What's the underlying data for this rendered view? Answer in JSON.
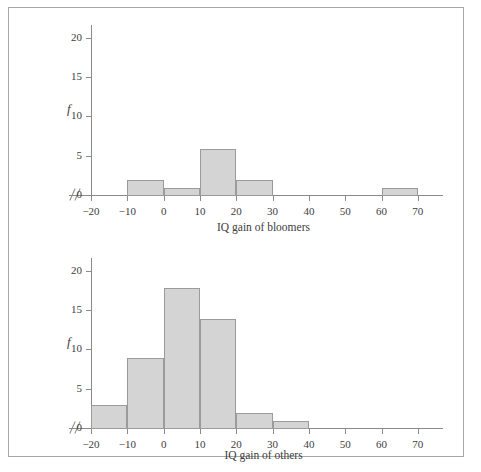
{
  "figure": {
    "y_axis_label": "f",
    "bar_fill_color": "#d4d4d4",
    "bar_border_color": "#9b9b9b",
    "axis_color": "#8a8a8a",
    "frame_color": "#a8a8a8"
  },
  "chart_data": [
    {
      "type": "bar",
      "title": "",
      "xlabel": "IQ gain of bloomers",
      "ylabel": "f",
      "xlim": [
        -20,
        75
      ],
      "ylim": [
        0,
        21
      ],
      "xticks": [
        -20,
        -10,
        0,
        10,
        20,
        30,
        40,
        50,
        60,
        70
      ],
      "yticks": [
        0,
        5,
        10,
        15,
        20
      ],
      "xtick_labels": [
        "-20",
        "-10",
        "0",
        "10",
        "20",
        "30",
        "40",
        "50",
        "60",
        "70"
      ],
      "ytick_labels": [
        "0",
        "5",
        "10",
        "15",
        "20"
      ],
      "axis_break": true,
      "grid": false,
      "legend": false,
      "bin_width": 10,
      "bins": [
        {
          "start": -10,
          "end": 0,
          "value": 2
        },
        {
          "start": 0,
          "end": 10,
          "value": 1
        },
        {
          "start": 10,
          "end": 20,
          "value": 6
        },
        {
          "start": 20,
          "end": 30,
          "value": 2
        },
        {
          "start": 60,
          "end": 70,
          "value": 1
        }
      ]
    },
    {
      "type": "bar",
      "title": "",
      "xlabel": "IQ gain of others",
      "ylabel": "f",
      "xlim": [
        -20,
        75
      ],
      "ylim": [
        0,
        21
      ],
      "xticks": [
        -20,
        -10,
        0,
        10,
        20,
        30,
        40,
        50,
        60,
        70
      ],
      "yticks": [
        0,
        5,
        10,
        15,
        20
      ],
      "xtick_labels": [
        "-20",
        "-10",
        "0",
        "10",
        "20",
        "30",
        "40",
        "50",
        "60",
        "70"
      ],
      "ytick_labels": [
        "0",
        "5",
        "10",
        "15",
        "20"
      ],
      "axis_break": true,
      "grid": false,
      "legend": false,
      "bin_width": 10,
      "bins": [
        {
          "start": -20,
          "end": -10,
          "value": 3
        },
        {
          "start": -10,
          "end": 0,
          "value": 9
        },
        {
          "start": 0,
          "end": 10,
          "value": 18
        },
        {
          "start": 10,
          "end": 20,
          "value": 14
        },
        {
          "start": 20,
          "end": 30,
          "value": 2
        },
        {
          "start": 30,
          "end": 40,
          "value": 1
        }
      ]
    }
  ]
}
